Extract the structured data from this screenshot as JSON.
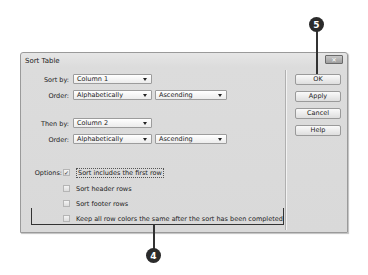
{
  "dialog": {
    "title": "Sort Table",
    "close_icon": "close-icon",
    "sort_by": {
      "label": "Sort by:",
      "value": "Column 1"
    },
    "order1": {
      "label": "Order:",
      "type": "Alphabetically",
      "direction": "Ascending"
    },
    "then_by": {
      "label": "Then by:",
      "value": "Column 2"
    },
    "order2": {
      "label": "Order:",
      "type": "Alphabetically",
      "direction": "Ascending"
    },
    "options": {
      "label": "Options:",
      "items": [
        {
          "label": "Sort includes the first row",
          "checked": true,
          "mark": "✓"
        },
        {
          "label": "Sort header rows",
          "checked": false,
          "mark": ""
        },
        {
          "label": "Sort footer rows",
          "checked": false,
          "mark": ""
        },
        {
          "label": "Keep all row colors the same after the sort has been completed",
          "checked": false,
          "mark": ""
        }
      ]
    },
    "buttons": {
      "ok": "OK",
      "apply": "Apply",
      "cancel": "Cancel",
      "help": "Help"
    }
  },
  "callouts": {
    "top": "5",
    "bottom": "4"
  },
  "colors": {
    "dialog_bg": "#d9d9d9",
    "callout_bg": "#2b2b2b",
    "border": "#9a9a9a"
  }
}
